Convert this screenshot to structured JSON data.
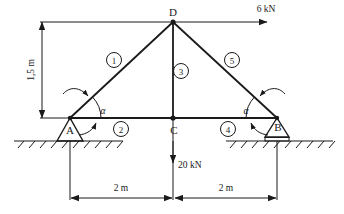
{
  "figure": {
    "type": "truss-free-body-diagram",
    "title": "",
    "nodes": [
      {
        "id": "A",
        "label": "A",
        "x": 0,
        "y": 0,
        "support": "pin"
      },
      {
        "id": "B",
        "label": "B",
        "x": 4,
        "y": 0,
        "support": "roller"
      },
      {
        "id": "C",
        "label": "C",
        "x": 2,
        "y": 0,
        "support": "none"
      },
      {
        "id": "D",
        "label": "D",
        "x": 2,
        "y": 1.5,
        "support": "none"
      }
    ],
    "members": [
      {
        "number": "1",
        "badge": "①",
        "from": "A",
        "to": "D"
      },
      {
        "number": "2",
        "badge": "②",
        "from": "A",
        "to": "C"
      },
      {
        "number": "3",
        "badge": "③",
        "from": "C",
        "to": "D"
      },
      {
        "number": "4",
        "badge": "④",
        "from": "C",
        "to": "B"
      },
      {
        "number": "5",
        "badge": "⑤",
        "from": "D",
        "to": "B"
      }
    ],
    "loads": [
      {
        "id": "horizontal-load",
        "label": "6 kN",
        "magnitude": 6,
        "unit": "kN",
        "direction": "right",
        "applied_at": "D"
      },
      {
        "id": "vertical-load",
        "label": "20 kN",
        "magnitude": 20,
        "unit": "kN",
        "direction": "down",
        "applied_at": "C"
      }
    ],
    "dimensions": [
      {
        "id": "height-dim",
        "label": "1,5 m",
        "value": 1.5,
        "unit": "m",
        "orientation": "vertical"
      },
      {
        "id": "span-left-dim",
        "label": "2 m",
        "value": 2,
        "unit": "m",
        "orientation": "horizontal"
      },
      {
        "id": "span-right-dim",
        "label": "2 m",
        "value": 2,
        "unit": "m",
        "orientation": "horizontal"
      }
    ],
    "angles": [
      {
        "id": "angle-at-a",
        "label": "α",
        "at": "A"
      },
      {
        "id": "angle-at-b",
        "label": "α",
        "at": "B"
      }
    ],
    "colors": {
      "line": "#1a1a1a",
      "text": "#1a1a1a",
      "background": "#ffffff"
    }
  }
}
